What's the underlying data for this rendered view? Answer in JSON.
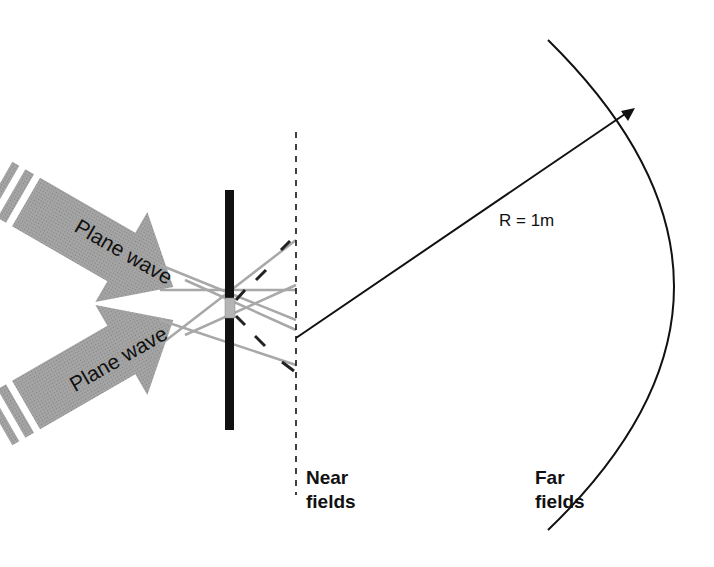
{
  "diagram": {
    "type": "antenna-field-measurement",
    "labels": {
      "plane_wave_top": "Plane wave",
      "plane_wave_bottom": "Plane wave",
      "radius": "R = 1m",
      "near_fields_line1": "Near",
      "near_fields_line2": "fields",
      "far_fields_line1": "Far",
      "far_fields_line2": "fields"
    },
    "colors": {
      "arrow_fill": "#9a9a9a",
      "line": "#111111",
      "grey_ray": "#a8a8a8",
      "aperture": "#b5b5b5",
      "background": "#ffffff"
    }
  }
}
